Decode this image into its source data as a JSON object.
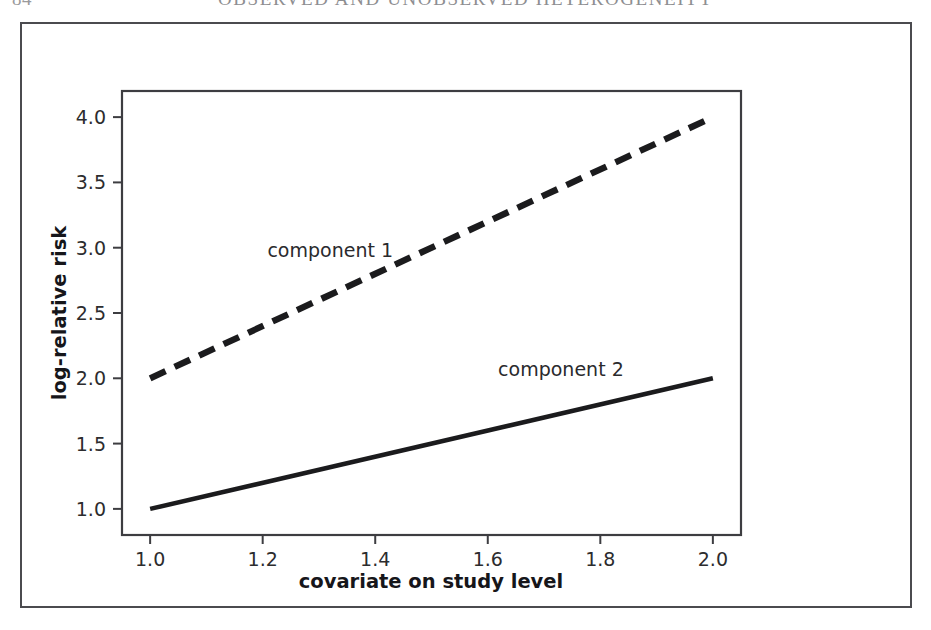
{
  "header": {
    "page_number": "84",
    "title": "OBSERVED AND UNOBSERVED HETEROGENEITY"
  },
  "chart_data": {
    "type": "line",
    "title": "",
    "xlabel": "covariate on study level",
    "ylabel": "log-relative risk",
    "xlim": [
      0.95,
      2.05
    ],
    "ylim": [
      0.8,
      4.2
    ],
    "xticks": [
      "1.0",
      "1.2",
      "1.4",
      "1.6",
      "1.8",
      "2.0"
    ],
    "xtick_values": [
      1.0,
      1.2,
      1.4,
      1.6,
      1.8,
      2.0
    ],
    "yticks": [
      "1.0",
      "1.5",
      "2.0",
      "2.5",
      "3.0",
      "3.5",
      "4.0"
    ],
    "ytick_values": [
      1.0,
      1.5,
      2.0,
      2.5,
      3.0,
      3.5,
      4.0
    ],
    "grid": false,
    "legend_position": "inline-annotation",
    "line_color": "#1b1b1d",
    "series": [
      {
        "name": "component 1",
        "style": "dashed",
        "x": [
          1.0,
          2.0
        ],
        "values": [
          2.0,
          4.0
        ],
        "label_x": 1.32,
        "label_y": 2.93
      },
      {
        "name": "component 2",
        "style": "solid",
        "x": [
          1.0,
          2.0
        ],
        "values": [
          1.0,
          2.0
        ],
        "label_x": 1.73,
        "label_y": 2.02
      }
    ]
  }
}
